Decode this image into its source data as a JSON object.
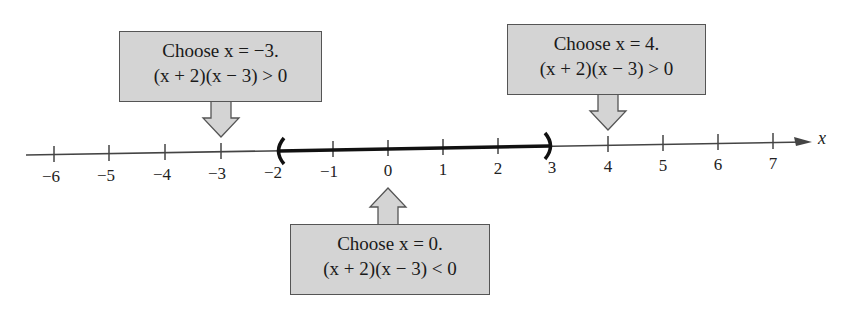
{
  "diagram": {
    "type": "number-line-test-intervals",
    "axis": {
      "variable": "x",
      "ticks": [
        "−6",
        "−5",
        "−4",
        "−3",
        "−2",
        "−1",
        "0",
        "1",
        "2",
        "3",
        "4",
        "5",
        "6",
        "7"
      ]
    },
    "solution_interval": {
      "left": "−2",
      "right": "3",
      "left_bracket": "(",
      "right_bracket": ")",
      "notation": "(−2, 3)"
    },
    "callouts": [
      {
        "id": "left",
        "line1": "Choose x = −3.",
        "line2": "(x + 2)(x − 3) > 0",
        "points_to": "−3",
        "direction": "down"
      },
      {
        "id": "middle",
        "line1": "Choose x = 0.",
        "line2": "(x + 2)(x − 3) < 0",
        "points_to": "0",
        "direction": "up"
      },
      {
        "id": "right",
        "line1": "Choose x = 4.",
        "line2": "(x + 2)(x − 3) > 0",
        "points_to": "4",
        "direction": "down"
      }
    ],
    "colors": {
      "callout_fill": "#d4d4d4",
      "callout_border": "#555555",
      "line": "#333333",
      "interval": "#111111"
    }
  }
}
